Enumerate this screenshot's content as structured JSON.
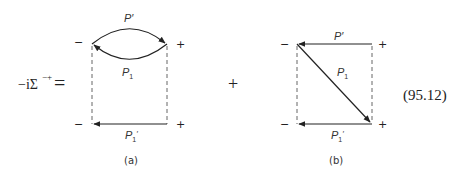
{
  "equation": {
    "lhs": "−iΣ",
    "lhs_superscript": "−+",
    "equals": "=",
    "plus": "+",
    "number": "(95.12)"
  },
  "diagram_a": {
    "caption": "(a)",
    "labels": {
      "top_arc": "P′",
      "bottom_arc": "P",
      "bottom_arc_sub": "1",
      "bottom_line": "P",
      "bottom_line_sub": "1",
      "bottom_line_prime": "′"
    },
    "vertex_signs": {
      "top_left": "−",
      "top_right": "+",
      "bottom_left": "−",
      "bottom_right": "+"
    }
  },
  "diagram_b": {
    "caption": "(b)",
    "labels": {
      "top_line": "P′",
      "diagonal": "P",
      "diagonal_sub": "1",
      "bottom_line": "P",
      "bottom_line_sub": "1",
      "bottom_line_prime": "′"
    },
    "vertex_signs": {
      "top_left": "−",
      "top_right": "+",
      "bottom_left": "−",
      "bottom_right": "+"
    }
  }
}
